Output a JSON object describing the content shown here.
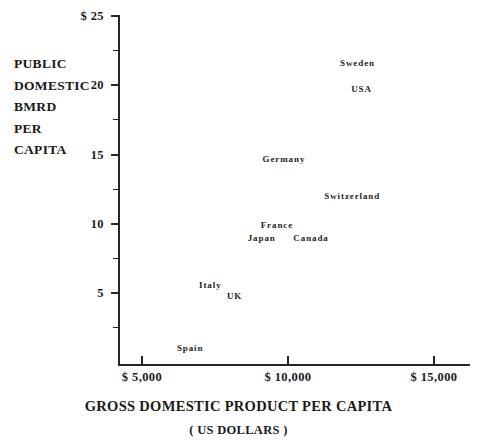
{
  "chart_data": {
    "type": "scatter",
    "title": "",
    "xlabel": "GROSS DOMESTIC PRODUCT PER CAPITA",
    "xsublabel": "( US DOLLARS )",
    "ylabel": "PUBLIC DOMESTIC BMRD PER CAPITA",
    "ylabel_lines": [
      "PUBLIC",
      "DOMESTIC",
      "BMRD",
      "PER",
      "CAPITA"
    ],
    "xlim": [
      3500,
      15800
    ],
    "ylim": [
      0,
      25
    ],
    "grid": false,
    "legend": "none",
    "x_tick_labels": [
      "$ 5,000",
      "$ 10,000",
      "$ 15,000"
    ],
    "x_tick_values": [
      5000,
      10000,
      15000
    ],
    "y_tick_labels": [
      "$ 25",
      "20",
      "15",
      "10",
      "5"
    ],
    "y_tick_values": [
      25,
      20,
      15,
      10,
      5
    ],
    "y_minor_tick_values": [
      22.5,
      17.5,
      12.5,
      7.5,
      2.5
    ],
    "point_label_style": "text-only",
    "points": [
      {
        "label": "Sweden",
        "x": 12380,
        "y": 21.6
      },
      {
        "label": "USA",
        "x": 12520,
        "y": 19.7
      },
      {
        "label": "Germany",
        "x": 9860,
        "y": 14.7
      },
      {
        "label": "Switzerland",
        "x": 12200,
        "y": 12.0
      },
      {
        "label": "France",
        "x": 9620,
        "y": 9.9
      },
      {
        "label": "Japan",
        "x": 9100,
        "y": 9.0
      },
      {
        "label": "Canada",
        "x": 10790,
        "y": 9.0
      },
      {
        "label": "Italy",
        "x": 7340,
        "y": 5.6
      },
      {
        "label": "UK",
        "x": 8170,
        "y": 4.8
      },
      {
        "label": "Spain",
        "x": 6650,
        "y": 1.0
      }
    ]
  },
  "colors": {
    "background": "#ffffff",
    "axis": "#262626",
    "text": "#1a1a1a",
    "point_label": "#242424"
  }
}
